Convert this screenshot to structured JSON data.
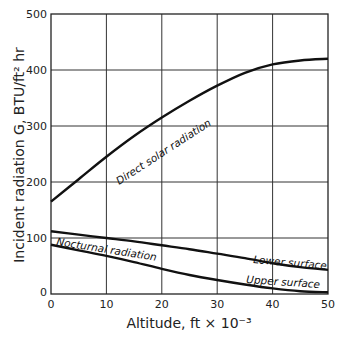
{
  "chart_data": {
    "type": "line",
    "title": "",
    "xlabel": "Altitude, ft × 10⁻³",
    "ylabel": "Incident radiation G, BTU/ft² hr",
    "xlim": [
      0,
      50
    ],
    "ylim": [
      0,
      500
    ],
    "xticks": [
      0,
      10,
      20,
      30,
      40,
      50
    ],
    "yticks": [
      0,
      100,
      200,
      300,
      400,
      500
    ],
    "grid": true,
    "legend": "none (inline curve labels)",
    "series": [
      {
        "name": "Direct solar radiation",
        "x": [
          0,
          5,
          10,
          15,
          20,
          25,
          30,
          35,
          40,
          45,
          50
        ],
        "y": [
          165,
          205,
          245,
          282,
          315,
          345,
          372,
          395,
          410,
          417,
          420
        ]
      },
      {
        "name": "Lower surface",
        "x": [
          0,
          5,
          10,
          15,
          20,
          25,
          30,
          35,
          40,
          45,
          50
        ],
        "y": [
          112,
          106,
          100,
          94,
          87,
          80,
          72,
          64,
          55,
          48,
          43
        ]
      },
      {
        "name": "Upper surface",
        "x": [
          0,
          5,
          10,
          15,
          20,
          25,
          30,
          35,
          40,
          45,
          50
        ],
        "y": [
          88,
          78,
          68,
          57,
          45,
          34,
          25,
          17,
          10,
          5,
          3
        ]
      }
    ],
    "annotations": [
      {
        "text": "Direct solar radiation",
        "series": "Direct solar radiation"
      },
      {
        "text": "Nocturnal radiation",
        "between": [
          "Lower surface",
          "Upper surface"
        ]
      },
      {
        "text": "Lower surface",
        "series": "Lower surface"
      },
      {
        "text": "Upper surface",
        "series": "Upper surface"
      }
    ]
  }
}
